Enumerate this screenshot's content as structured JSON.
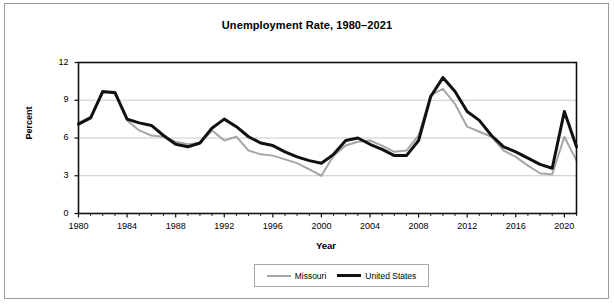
{
  "chart_data": {
    "type": "line",
    "title": "Unemployment Rate, 1980–2021",
    "xlabel": "Year",
    "ylabel": "Percent",
    "ylim": [
      0,
      12
    ],
    "xlim": [
      1980,
      2021
    ],
    "ytick_labels": [
      "0",
      "3",
      "6",
      "9",
      "12"
    ],
    "yticks": [
      0,
      3,
      6,
      9,
      12
    ],
    "xtick_labels": [
      "1980",
      "1984",
      "1988",
      "1992",
      "1996",
      "2000",
      "2004",
      "2008",
      "2012",
      "2016",
      "2020"
    ],
    "xticks": [
      1980,
      1984,
      1988,
      1992,
      1996,
      2000,
      2004,
      2008,
      2012,
      2016,
      2020
    ],
    "grid": "horizontal",
    "legend_position": "bottom",
    "x": [
      1980,
      1981,
      1982,
      1983,
      1984,
      1985,
      1986,
      1987,
      1988,
      1989,
      1990,
      1991,
      1992,
      1993,
      1994,
      1995,
      1996,
      1997,
      1998,
      1999,
      2000,
      2001,
      2002,
      2003,
      2004,
      2005,
      2006,
      2007,
      2008,
      2009,
      2010,
      2011,
      2012,
      2013,
      2014,
      2015,
      2016,
      2017,
      2018,
      2019,
      2020,
      2021
    ],
    "series": [
      {
        "name": "Missouri",
        "color": "#a6a6a6",
        "width": 2,
        "values": [
          7.2,
          7.7,
          9.6,
          9.7,
          7.4,
          6.6,
          6.2,
          6.1,
          5.7,
          5.5,
          5.6,
          6.6,
          5.8,
          6.1,
          5.0,
          4.7,
          4.6,
          4.3,
          4.0,
          3.5,
          3.0,
          4.6,
          5.4,
          5.7,
          5.8,
          5.4,
          4.9,
          5.0,
          6.2,
          9.4,
          9.9,
          8.7,
          6.9,
          6.5,
          6.1,
          5.0,
          4.5,
          3.8,
          3.2,
          3.1,
          6.1,
          4.2
        ]
      },
      {
        "name": "United States",
        "color": "#111111",
        "width": 3,
        "values": [
          7.1,
          7.6,
          9.7,
          9.6,
          7.5,
          7.2,
          7.0,
          6.2,
          5.5,
          5.3,
          5.6,
          6.8,
          7.5,
          6.9,
          6.1,
          5.6,
          5.4,
          4.9,
          4.5,
          4.2,
          4.0,
          4.7,
          5.8,
          6.0,
          5.5,
          5.1,
          4.6,
          4.6,
          5.8,
          9.3,
          10.8,
          9.7,
          8.1,
          7.4,
          6.2,
          5.3,
          4.9,
          4.4,
          3.9,
          3.6,
          8.1,
          5.3
        ]
      }
    ]
  },
  "legend": {
    "entries": [
      {
        "label": "Missouri"
      },
      {
        "label": "United States"
      }
    ]
  }
}
